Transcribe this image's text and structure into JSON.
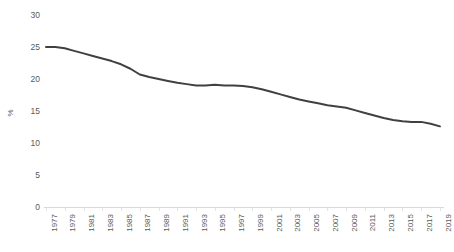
{
  "chart_data": {
    "type": "line",
    "title": "",
    "subtitle": "",
    "xlabel": "",
    "ylabel": "%",
    "ylim": [
      0,
      30
    ],
    "ytick_step": 5,
    "ytick_labels": [
      "30",
      "25",
      "20",
      "15",
      "10",
      "5",
      "0"
    ],
    "ytick_values": [
      30,
      25,
      20,
      15,
      10,
      5,
      0
    ],
    "xlim": [
      1977,
      2019
    ],
    "xtick_labels": [
      "1977",
      "1979",
      "1981",
      "1983",
      "1985",
      "1987",
      "1989",
      "1991",
      "1993",
      "1995",
      "1997",
      "1999",
      "2001",
      "2003",
      "2005",
      "2007",
      "2009",
      "2011",
      "2013",
      "2015",
      "2017",
      "2019"
    ],
    "grid": false,
    "legend": false,
    "legend_position": "none",
    "line_color": "#404040",
    "axis_color": "#d9d9d9",
    "text_color": "#595959",
    "x": [
      1977,
      1978,
      1979,
      1980,
      1981,
      1982,
      1983,
      1984,
      1985,
      1986,
      1987,
      1988,
      1989,
      1990,
      1991,
      1992,
      1993,
      1994,
      1995,
      1996,
      1997,
      1998,
      1999,
      2000,
      2001,
      2002,
      2003,
      2004,
      2005,
      2006,
      2007,
      2008,
      2009,
      2010,
      2011,
      2012,
      2013,
      2014,
      2015,
      2016,
      2017,
      2018,
      2019
    ],
    "values": [
      25.0,
      25.0,
      24.8,
      24.4,
      24.0,
      23.6,
      23.2,
      22.8,
      22.3,
      21.6,
      20.7,
      20.3,
      20.0,
      19.7,
      19.4,
      19.2,
      19.0,
      19.0,
      19.1,
      19.0,
      19.0,
      18.9,
      18.7,
      18.4,
      18.0,
      17.6,
      17.2,
      16.8,
      16.5,
      16.2,
      15.9,
      15.7,
      15.5,
      15.1,
      14.7,
      14.3,
      13.9,
      13.6,
      13.4,
      13.3,
      13.3,
      13.0,
      12.6
    ],
    "series_name": ""
  }
}
